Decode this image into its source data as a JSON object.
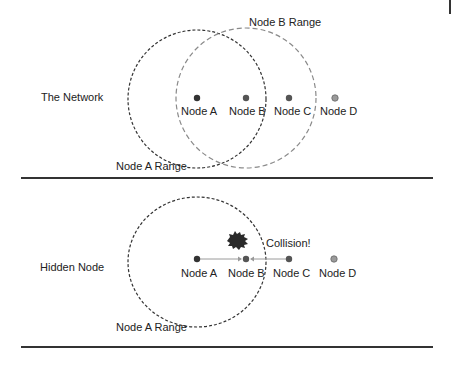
{
  "panels": [
    {
      "title": "The Network",
      "ranges": [
        {
          "label": "Node A Range",
          "style": "dashed-dark"
        },
        {
          "label": "Node B Range",
          "style": "dashed-light"
        }
      ],
      "nodes": [
        {
          "label": "Node A",
          "color": "#333333"
        },
        {
          "label": "Node B",
          "color": "#555555"
        },
        {
          "label": "Node C",
          "color": "#555555"
        },
        {
          "label": "Node D",
          "color": "#9a9a9a"
        }
      ]
    },
    {
      "title": "Hidden Node",
      "ranges": [
        {
          "label": "Node A Range",
          "style": "dashed-dark"
        }
      ],
      "nodes": [
        {
          "label": "Node A",
          "color": "#333333"
        },
        {
          "label": "Node B",
          "color": "#555555"
        },
        {
          "label": "Node C",
          "color": "#555555"
        },
        {
          "label": "Node D",
          "color": "#9a9a9a"
        }
      ],
      "transmissions": [
        {
          "from": "Node A",
          "to": "Node B"
        },
        {
          "from": "Node C",
          "to": "Node B"
        }
      ],
      "collision_label": "Collision!"
    }
  ],
  "colors": {
    "dark_range": "#333333",
    "light_range": "#8a8a8a",
    "arrow": "#9a9a9a",
    "divider": "#333333",
    "collision": "#2a2a2a"
  }
}
